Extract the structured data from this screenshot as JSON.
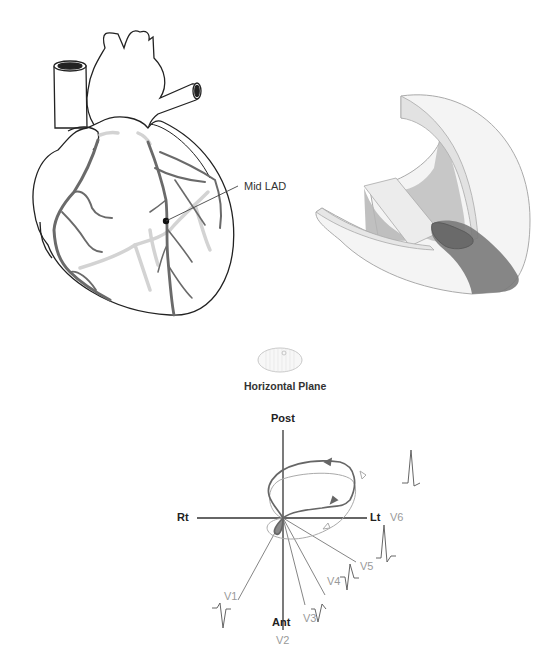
{
  "heart": {
    "annotation_label": "Mid LAD",
    "marker": "occlusion-dot"
  },
  "plane_icon": {
    "caption": "Horizontal Plane"
  },
  "vector_diagram": {
    "axes": {
      "top": "Post",
      "bottom": "Ant",
      "left": "Rt",
      "right": "Lt"
    },
    "leads": [
      {
        "name": "V1"
      },
      {
        "name": "V2"
      },
      {
        "name": "V3"
      },
      {
        "name": "V4"
      },
      {
        "name": "V5"
      },
      {
        "name": "V6"
      }
    ]
  },
  "colors": {
    "outline": "#222222",
    "artery": "#6a6a6a",
    "artery_light": "#d2d2d2",
    "infarct": "#7a7a7a",
    "lead_label": "#9a9a9a"
  }
}
